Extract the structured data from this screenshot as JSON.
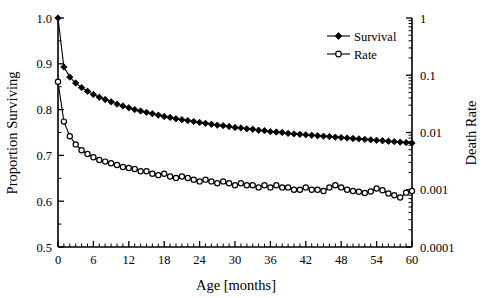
{
  "chart_data": {
    "type": "line",
    "title": "",
    "xlabel": "Age [months]",
    "ylabel": "Proportion Surviving",
    "y2label": "Death Rate",
    "xlim": [
      0,
      60
    ],
    "ylim": [
      0.5,
      1.0
    ],
    "y2lim": [
      0.0001,
      1
    ],
    "y2scale": "log",
    "grid": false,
    "legend_position": "top-right",
    "xticks": [
      0,
      6,
      12,
      18,
      24,
      30,
      36,
      42,
      48,
      54,
      60
    ],
    "xtick_labels": [
      "0",
      "6",
      "12",
      "18",
      "24",
      "30",
      "36",
      "42",
      "48",
      "54",
      "60"
    ],
    "xminor_interval": 1,
    "yticks": [
      0.5,
      0.6,
      0.7,
      0.8,
      0.9,
      1.0
    ],
    "ytick_labels": [
      "0.5",
      "0.6",
      "0.7",
      "0.8",
      "0.9",
      "1.0"
    ],
    "y2ticks": [
      0.0001,
      0.001,
      0.01,
      0.1,
      1
    ],
    "y2tick_labels": [
      "0.0001",
      "0.001",
      "0.01",
      "0.1",
      "1"
    ],
    "series": [
      {
        "name": "Survival",
        "axis": "left",
        "marker": "filled-diamond",
        "x": [
          0,
          1,
          2,
          3,
          4,
          5,
          6,
          7,
          8,
          9,
          10,
          11,
          12,
          13,
          14,
          15,
          16,
          17,
          18,
          19,
          20,
          21,
          22,
          23,
          24,
          25,
          26,
          27,
          28,
          29,
          30,
          31,
          32,
          33,
          34,
          35,
          36,
          37,
          38,
          39,
          40,
          41,
          42,
          43,
          44,
          45,
          46,
          47,
          48,
          49,
          50,
          51,
          52,
          53,
          54,
          55,
          56,
          57,
          58,
          59,
          60
        ],
        "values": [
          1.0,
          0.893,
          0.871,
          0.858,
          0.848,
          0.84,
          0.833,
          0.827,
          0.822,
          0.817,
          0.812,
          0.808,
          0.804,
          0.8,
          0.797,
          0.794,
          0.791,
          0.788,
          0.785,
          0.783,
          0.78,
          0.778,
          0.776,
          0.774,
          0.772,
          0.77,
          0.768,
          0.766,
          0.765,
          0.763,
          0.761,
          0.76,
          0.758,
          0.757,
          0.755,
          0.754,
          0.752,
          0.751,
          0.75,
          0.748,
          0.747,
          0.746,
          0.745,
          0.744,
          0.743,
          0.742,
          0.741,
          0.74,
          0.739,
          0.738,
          0.737,
          0.736,
          0.735,
          0.734,
          0.733,
          0.732,
          0.731,
          0.73,
          0.729,
          0.728,
          0.727
        ]
      },
      {
        "name": "Rate",
        "axis": "right",
        "marker": "open-circle",
        "x": [
          0,
          1,
          2,
          3,
          4,
          5,
          6,
          7,
          8,
          9,
          10,
          11,
          12,
          13,
          14,
          15,
          16,
          17,
          18,
          19,
          20,
          21,
          22,
          23,
          24,
          25,
          26,
          27,
          28,
          29,
          30,
          31,
          32,
          33,
          34,
          35,
          36,
          37,
          38,
          39,
          40,
          41,
          42,
          43,
          44,
          45,
          46,
          47,
          48,
          49,
          50,
          51,
          52,
          53,
          54,
          55,
          56,
          57,
          58,
          59,
          60
        ],
        "values": [
          0.077,
          0.0155,
          0.0086,
          0.0062,
          0.0049,
          0.0042,
          0.0037,
          0.0033,
          0.0031,
          0.0029,
          0.0027,
          0.0025,
          0.0024,
          0.0023,
          0.0021,
          0.0021,
          0.0019,
          0.0018,
          0.0019,
          0.0017,
          0.0016,
          0.0017,
          0.0016,
          0.0015,
          0.0014,
          0.0015,
          0.0014,
          0.0013,
          0.0014,
          0.0013,
          0.0012,
          0.0013,
          0.0012,
          0.0012,
          0.0011,
          0.0012,
          0.0011,
          0.0012,
          0.0011,
          0.0011,
          0.001,
          0.001,
          0.0011,
          0.001,
          0.001,
          0.00095,
          0.0011,
          0.0012,
          0.0011,
          0.001,
          0.00095,
          0.00092,
          0.00088,
          0.00093,
          0.00105,
          0.00098,
          0.00086,
          0.0008,
          0.00073,
          0.00089,
          0.00095
        ]
      }
    ]
  },
  "legend": {
    "entries": [
      {
        "label": "Survival",
        "marker": "filled-diamond"
      },
      {
        "label": "Rate",
        "marker": "open-circle"
      }
    ]
  }
}
